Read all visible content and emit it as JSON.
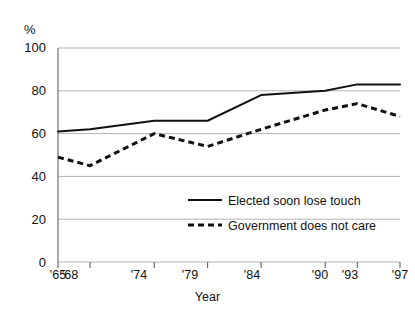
{
  "figure": {
    "partial_title": "",
    "y_unit_label": "%",
    "x_axis_title": "Year"
  },
  "chart_data": {
    "type": "line",
    "title": "",
    "xlabel": "Year",
    "ylabel": "%",
    "ylim": [
      0,
      100
    ],
    "yticks": [
      0,
      20,
      40,
      60,
      80,
      100
    ],
    "ytick_labels": [
      "0",
      "20",
      "40",
      "60",
      "80",
      "100"
    ],
    "x": [
      1965,
      1968,
      1974,
      1979,
      1984,
      1990,
      1993,
      1997
    ],
    "categories": [
      "'65",
      "'68",
      "'74",
      "'79",
      "'84",
      "'90",
      "'93",
      "'97"
    ],
    "grid": true,
    "legend_position": "center-right-inside",
    "series": [
      {
        "name": "Elected soon lose touch",
        "style": "solid",
        "color": "#111111",
        "values": [
          61,
          62,
          66,
          66,
          78,
          80,
          83,
          83
        ]
      },
      {
        "name": "Government does not care",
        "style": "dashed",
        "color": "#111111",
        "values": [
          49,
          45,
          60,
          54,
          62,
          71,
          74,
          68
        ]
      }
    ]
  },
  "colors": {
    "grid": "#b4b4b4",
    "axis": "#555555",
    "line": "#111111",
    "text": "#121212"
  }
}
